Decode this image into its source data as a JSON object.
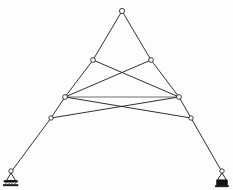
{
  "figure": {
    "background_color": "#fdfdfd",
    "line_color": "#1a1a1a",
    "joint_fill_color": "#ffffff",
    "support_color": "#111111",
    "width": 233,
    "height": 190
  },
  "chart_data": {
    "type": "diagram",
    "xlabel": "",
    "ylabel": "",
    "xlim": [
      0,
      233
    ],
    "ylim": [
      0,
      190
    ],
    "grid": false,
    "legend": "none",
    "nodes": [
      {
        "id": "apex",
        "label": "apex",
        "x": 122,
        "y": 11,
        "marker": "open-circle",
        "radius": 2.6
      },
      {
        "id": "upper_left",
        "label": "upper left joint",
        "x": 93,
        "y": 60,
        "marker": "open-circle",
        "radius": 2.4
      },
      {
        "id": "upper_right",
        "label": "upper right joint",
        "x": 151,
        "y": 60,
        "marker": "open-circle",
        "radius": 2.4
      },
      {
        "id": "mid_left",
        "label": "mid left joint",
        "x": 65,
        "y": 97,
        "marker": "open-circle",
        "radius": 2.4
      },
      {
        "id": "mid_right",
        "label": "mid right joint",
        "x": 179,
        "y": 97,
        "marker": "open-circle",
        "radius": 2.4
      },
      {
        "id": "lower_left",
        "label": "lower left joint",
        "x": 51,
        "y": 118,
        "marker": "open-circle",
        "radius": 2.2
      },
      {
        "id": "lower_right",
        "label": "lower right joint",
        "x": 191,
        "y": 118,
        "marker": "open-circle",
        "radius": 2.2
      },
      {
        "id": "support_left",
        "label": "left support node",
        "x": 11,
        "y": 172,
        "marker": "open-circle",
        "radius": 2.2
      },
      {
        "id": "support_right",
        "label": "right support node",
        "x": 222,
        "y": 172,
        "marker": "open-circle",
        "radius": 2.2
      }
    ],
    "members": [
      {
        "id": "m1",
        "from": "apex",
        "to": "upper_left",
        "style": "solid"
      },
      {
        "id": "m2",
        "from": "apex",
        "to": "upper_right",
        "style": "solid"
      },
      {
        "id": "m3",
        "from": "upper_left",
        "to": "mid_left",
        "style": "solid"
      },
      {
        "id": "m4",
        "from": "upper_right",
        "to": "mid_right",
        "style": "solid"
      },
      {
        "id": "m5",
        "from": "mid_left",
        "to": "lower_left",
        "style": "solid"
      },
      {
        "id": "m6",
        "from": "mid_right",
        "to": "lower_right",
        "style": "solid"
      },
      {
        "id": "m7",
        "from": "lower_left",
        "to": "support_left",
        "style": "solid"
      },
      {
        "id": "m8",
        "from": "lower_right",
        "to": "support_right",
        "style": "solid"
      },
      {
        "id": "m9",
        "from": "upper_left",
        "to": "mid_right",
        "style": "diagonal"
      },
      {
        "id": "m10",
        "from": "upper_right",
        "to": "mid_left",
        "style": "diagonal"
      },
      {
        "id": "m11",
        "from": "mid_left",
        "to": "mid_right",
        "style": "chord"
      },
      {
        "id": "m12",
        "from": "lower_left",
        "to": "mid_right",
        "style": "diagonal"
      },
      {
        "id": "m13",
        "from": "lower_right",
        "to": "mid_left",
        "style": "diagonal"
      }
    ],
    "crossing_point": {
      "x": 122,
      "y": 78
    },
    "supports": [
      {
        "id": "support_left",
        "type": "pinned-hatched",
        "x": 11,
        "y": 172
      },
      {
        "id": "support_right",
        "type": "pinned-filled",
        "x": 222,
        "y": 172
      }
    ]
  }
}
